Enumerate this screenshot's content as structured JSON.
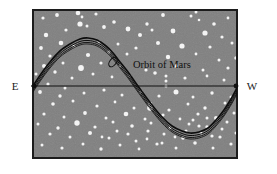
{
  "figure": {
    "name": "orbit-of-mars-diagram",
    "canvas": {
      "width": 277,
      "height": 174,
      "background": "#ffffff"
    },
    "sky_panel": {
      "name": "night-sky-panel",
      "x": 33,
      "y": 10,
      "width": 204,
      "height": 148,
      "fill": "#808080",
      "border_color": "#1c1c1c",
      "border_width": 2
    },
    "horizon_line": {
      "name": "horizon-line",
      "y": 86,
      "x_start": 31,
      "x_end": 238,
      "color": "#111111",
      "end_markers": "filled-dots",
      "marker_radius": 2.4
    },
    "direction_labels": [
      {
        "id": "east",
        "text": "E",
        "x": 15,
        "y": 90
      },
      {
        "id": "west",
        "text": "W",
        "x": 252,
        "y": 90
      }
    ],
    "orbit_curve": {
      "name": "orbit-of-mars-path",
      "label": "Orbit of Mars",
      "label_x": 133,
      "label_y": 65,
      "color": "#0d0d0d",
      "stroke_widths": [
        1.7,
        1.0,
        0.9,
        0.8
      ],
      "band_offsets": [
        0,
        2.5,
        4.5,
        6.0
      ],
      "retrograde_loop": {
        "cx": 113,
        "cy": 62,
        "rx": 5.5,
        "ry": 3.2,
        "rotation": -52
      },
      "description": "sinusoidal apparent path crossing horizon, peak upper-left, trough lower-right"
    },
    "colors": {
      "sky": "#808080",
      "star": "#f4f4f4",
      "ink": "#111111",
      "page": "#ffffff"
    }
  },
  "chart_data": {
    "type": "line",
    "title": "Orbit of Mars",
    "xlabel": "",
    "ylabel": "",
    "annotations": [
      "E",
      "W",
      "Orbit of Mars"
    ],
    "axis_line_y": 86,
    "xlim": [
      33,
      237
    ],
    "ylim": [
      10,
      158
    ],
    "series": [
      {
        "name": "Orbit of Mars",
        "description": "apparent path of Mars across the sky from east to west, with retrograde loop",
        "points": [
          [
            33,
            86
          ],
          [
            41,
            74
          ],
          [
            50,
            62
          ],
          [
            60,
            51
          ],
          [
            70,
            44
          ],
          [
            80,
            39
          ],
          [
            88,
            38
          ],
          [
            97,
            40
          ],
          [
            106,
            46
          ],
          [
            113,
            53
          ],
          [
            120,
            62
          ],
          [
            128,
            72
          ],
          [
            135,
            82
          ],
          [
            143,
            93
          ],
          [
            152,
            105
          ],
          [
            162,
            117
          ],
          [
            172,
            126
          ],
          [
            182,
            131
          ],
          [
            190,
            133
          ],
          [
            199,
            132
          ],
          [
            208,
            128
          ],
          [
            216,
            120
          ],
          [
            224,
            110
          ],
          [
            231,
            99
          ],
          [
            237,
            88
          ]
        ]
      },
      {
        "name": "Horizon (E-W line)",
        "points": [
          [
            31,
            86
          ],
          [
            238,
            86
          ]
        ]
      }
    ],
    "stars": [
      [
        43,
        18,
        1.6
      ],
      [
        57,
        15,
        1.9
      ],
      [
        78,
        13,
        2.3
      ],
      [
        82,
        17,
        1.4
      ],
      [
        80,
        24,
        2.6
      ],
      [
        96,
        14,
        1.6
      ],
      [
        114,
        22,
        1.8
      ],
      [
        128,
        29,
        2.4
      ],
      [
        147,
        24,
        1.7
      ],
      [
        163,
        15,
        1.9
      ],
      [
        191,
        16,
        1.5
      ],
      [
        196,
        12,
        1.5
      ],
      [
        199,
        20,
        1.3
      ],
      [
        214,
        24,
        1.8
      ],
      [
        228,
        18,
        1.4
      ],
      [
        140,
        35,
        2.0
      ],
      [
        152,
        30,
        1.5
      ],
      [
        173,
        31,
        2.4
      ],
      [
        205,
        33,
        2.6
      ],
      [
        222,
        37,
        1.6
      ],
      [
        46,
        35,
        2.2
      ],
      [
        66,
        30,
        1.6
      ],
      [
        87,
        26,
        1.5
      ],
      [
        104,
        27,
        1.9
      ],
      [
        41,
        48,
        1.9
      ],
      [
        61,
        43,
        2.3
      ],
      [
        74,
        46,
        1.5
      ],
      [
        99,
        42,
        1.7
      ],
      [
        118,
        44,
        1.5
      ],
      [
        136,
        48,
        1.6
      ],
      [
        158,
        43,
        2.0
      ],
      [
        182,
        46,
        2.6
      ],
      [
        210,
        47,
        1.6
      ],
      [
        232,
        43,
        1.5
      ],
      [
        50,
        56,
        1.6
      ],
      [
        88,
        55,
        2.1
      ],
      [
        109,
        52,
        1.8
      ],
      [
        127,
        54,
        1.5
      ],
      [
        168,
        57,
        2.2
      ],
      [
        196,
        54,
        1.4
      ],
      [
        219,
        60,
        1.5
      ],
      [
        236,
        58,
        1.8
      ],
      [
        44,
        66,
        2.0
      ],
      [
        63,
        63,
        1.5
      ],
      [
        81,
        68,
        2.9
      ],
      [
        101,
        63,
        1.6
      ],
      [
        120,
        66,
        1.4
      ],
      [
        146,
        70,
        1.6
      ],
      [
        176,
        66,
        1.9
      ],
      [
        203,
        70,
        1.5
      ],
      [
        228,
        68,
        1.6
      ],
      [
        36,
        74,
        1.5
      ],
      [
        55,
        72,
        1.7
      ],
      [
        72,
        78,
        1.5
      ],
      [
        93,
        74,
        1.5
      ],
      [
        112,
        77,
        1.4
      ],
      [
        130,
        76,
        1.5
      ],
      [
        155,
        73,
        1.8
      ],
      [
        166,
        76,
        1.5
      ],
      [
        166,
        81,
        1.5
      ],
      [
        185,
        78,
        1.6
      ],
      [
        207,
        76,
        1.4
      ],
      [
        224,
        80,
        1.5
      ],
      [
        166,
        86,
        1.5
      ],
      [
        48,
        84,
        1.6
      ],
      [
        65,
        88,
        1.5
      ],
      [
        40,
        92,
        1.9
      ],
      [
        60,
        96,
        1.7
      ],
      [
        84,
        93,
        1.5
      ],
      [
        104,
        90,
        1.6
      ],
      [
        122,
        95,
        1.5
      ],
      [
        141,
        92,
        1.8
      ],
      [
        159,
        96,
        1.6
      ],
      [
        176,
        92,
        2.5
      ],
      [
        193,
        97,
        1.5
      ],
      [
        212,
        93,
        1.7
      ],
      [
        231,
        97,
        1.5
      ],
      [
        53,
        104,
        1.8
      ],
      [
        73,
        101,
        1.5
      ],
      [
        97,
        106,
        1.6
      ],
      [
        115,
        102,
        1.4
      ],
      [
        134,
        108,
        1.5
      ],
      [
        150,
        104,
        2.2
      ],
      [
        150,
        108,
        2.8
      ],
      [
        169,
        110,
        1.6
      ],
      [
        188,
        104,
        1.5
      ],
      [
        205,
        108,
        1.7
      ],
      [
        225,
        103,
        1.5
      ],
      [
        44,
        114,
        1.6
      ],
      [
        64,
        117,
        1.5
      ],
      [
        85,
        113,
        1.9
      ],
      [
        106,
        118,
        1.5
      ],
      [
        126,
        114,
        2.3
      ],
      [
        145,
        119,
        1.5
      ],
      [
        163,
        115,
        1.6
      ],
      [
        180,
        119,
        1.4
      ],
      [
        198,
        114,
        1.6
      ],
      [
        216,
        118,
        2.0
      ],
      [
        234,
        113,
        1.5
      ],
      [
        38,
        124,
        1.5
      ],
      [
        58,
        128,
        1.7
      ],
      [
        77,
        123,
        2.7
      ],
      [
        95,
        127,
        1.6
      ],
      [
        113,
        122,
        1.5
      ],
      [
        132,
        126,
        1.8
      ],
      [
        151,
        123,
        1.5
      ],
      [
        170,
        128,
        1.6
      ],
      [
        189,
        124,
        1.5
      ],
      [
        207,
        127,
        1.7
      ],
      [
        227,
        122,
        1.5
      ],
      [
        50,
        134,
        1.6
      ],
      [
        70,
        137,
        1.5
      ],
      [
        90,
        133,
        2.0
      ],
      [
        109,
        138,
        1.5
      ],
      [
        128,
        134,
        1.6
      ],
      [
        147,
        139,
        1.4
      ],
      [
        164,
        134,
        1.5
      ],
      [
        183,
        138,
        1.8
      ],
      [
        201,
        133,
        1.5
      ],
      [
        220,
        137,
        1.6
      ],
      [
        236,
        133,
        1.5
      ],
      [
        42,
        145,
        1.5
      ],
      [
        62,
        148,
        1.6
      ],
      [
        83,
        144,
        1.5
      ],
      [
        101,
        149,
        1.7
      ],
      [
        120,
        145,
        1.5
      ],
      [
        139,
        149,
        1.4
      ],
      [
        157,
        144,
        1.6
      ],
      [
        176,
        148,
        1.5
      ],
      [
        195,
        143,
        1.8
      ],
      [
        213,
        148,
        1.5
      ],
      [
        231,
        144,
        1.6
      ],
      [
        193,
        120,
        1.5
      ],
      [
        199,
        126,
        1.6
      ],
      [
        186,
        131,
        1.5
      ],
      [
        175,
        137,
        1.4
      ],
      [
        207,
        118,
        1.5
      ],
      [
        212,
        136,
        1.6
      ],
      [
        222,
        129,
        1.5
      ],
      [
        162,
        143,
        1.5
      ],
      [
        148,
        131,
        1.6
      ],
      [
        136,
        141,
        1.5
      ],
      [
        117,
        131,
        1.5
      ],
      [
        102,
        137,
        1.4
      ]
    ]
  }
}
